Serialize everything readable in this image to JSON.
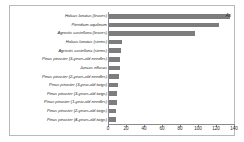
{
  "chart_data": {
    "type": "bar",
    "orientation": "horizontal",
    "title": "",
    "xlabel": "",
    "ylabel": "",
    "xlim": [
      0,
      140
    ],
    "xticks": [
      0,
      20,
      40,
      60,
      80,
      100,
      120,
      140
    ],
    "grid": false,
    "legend": "",
    "series_annotation": "As",
    "bar_color": "#7d7d7d",
    "categories": [
      "Holcus lanatus (leaves)",
      "Pteridium aquilinum",
      "Agrostis castellana (leaves)",
      "Holcus lanatus (stems)",
      "Agrostis castellana (stems)",
      "Pinus pinaster (3-years-old needles)",
      "Juncus effusus",
      "Pinus pinaster (2-years-old needles)",
      "Pinus pinaster (3-year-old twigs)",
      "Pinus pinaster (3-years-old twigs)",
      "Pinus pinaster (1-year-old needles)",
      "Pinus pinaster (2-years-old twigs)",
      "Pinus pinaster (4-years-old twigs)"
    ],
    "values": [
      134,
      122,
      95,
      14,
      13.5,
      12.5,
      12,
      11.5,
      9.5,
      9,
      8.5,
      8,
      7.5
    ]
  }
}
